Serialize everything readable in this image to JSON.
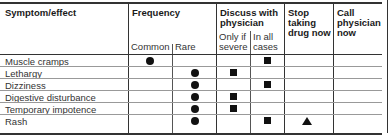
{
  "table": {
    "headers": {
      "symptom": "Symptom/effect",
      "frequency": "Frequency",
      "discuss_line1": "Discuss with",
      "discuss_line2": "physician",
      "stop_line1": "Stop",
      "stop_line2": "taking",
      "stop_line3": "drug now",
      "call_line1": "Call",
      "call_line2": "physician",
      "call_line3": "now"
    },
    "subheaders": {
      "common": "Common",
      "rare": "Rare",
      "only_if_line1": "Only if",
      "only_if_line2": "severe",
      "in_all_line1": "In all",
      "in_all_line2": "cases"
    },
    "rows": [
      {
        "label": "Muscle cramps",
        "common": true,
        "rare": false,
        "only_if_severe": false,
        "in_all_cases": true,
        "stop_now": false,
        "call_now": false
      },
      {
        "label": "Lethargy",
        "common": false,
        "rare": true,
        "only_if_severe": true,
        "in_all_cases": false,
        "stop_now": false,
        "call_now": false
      },
      {
        "label": "Dizziness",
        "common": false,
        "rare": true,
        "only_if_severe": false,
        "in_all_cases": true,
        "stop_now": false,
        "call_now": false
      },
      {
        "label": "Digestive disturbance",
        "common": false,
        "rare": true,
        "only_if_severe": true,
        "in_all_cases": false,
        "stop_now": false,
        "call_now": false
      },
      {
        "label": "Temporary impotence",
        "common": false,
        "rare": true,
        "only_if_severe": true,
        "in_all_cases": false,
        "stop_now": false,
        "call_now": false
      },
      {
        "label": "Rash",
        "common": false,
        "rare": true,
        "only_if_severe": false,
        "in_all_cases": true,
        "stop_now": true,
        "call_now": false
      }
    ],
    "markers": {
      "frequency": "circle",
      "discuss": "square",
      "stop": "triangle"
    }
  }
}
